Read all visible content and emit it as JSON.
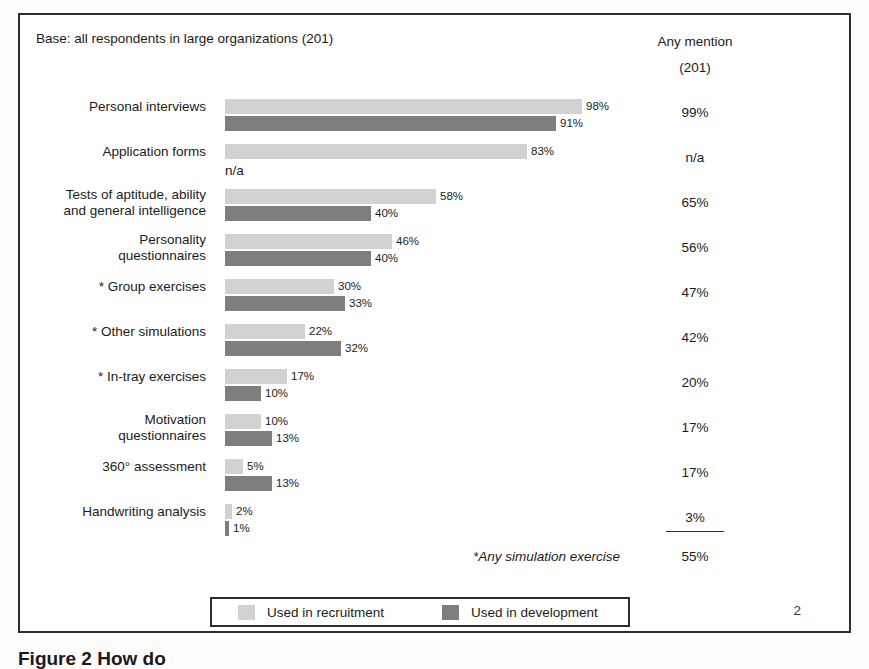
{
  "header": {
    "base_note": "Base: all respondents in large organizations (201)",
    "any_mention_title": "Any mention",
    "any_mention_base": "(201)"
  },
  "legend": {
    "recruit_label": "Used in recruitment",
    "develop_label": "Used in development",
    "recruit_color": "#d2d2d2",
    "develop_color": "#7e7e7e"
  },
  "summary": {
    "sim_label": "*Any simulation exercise",
    "sim_value": "55%"
  },
  "page_number": "2",
  "figure_caption": "Figure 2  How do",
  "chart_data": {
    "type": "bar",
    "title": "Base: all respondents in large organizations (201)",
    "xlabel": "",
    "ylabel": "",
    "xlim": [
      0,
      100
    ],
    "grid": false,
    "legend_position": "bottom",
    "orientation": "horizontal",
    "categories": [
      "Personal interviews",
      "Application forms",
      "Tests of aptitude, ability\nand general intelligence",
      "Personality\nquestionnaires",
      "* Group exercises",
      "* Other simulations",
      "* In-tray exercises",
      "Motivation\nquestionnaires",
      "360° assessment",
      "Handwriting analysis"
    ],
    "series": [
      {
        "name": "Used in recruitment",
        "color": "#d2d2d2",
        "values": [
          98,
          83,
          58,
          46,
          30,
          22,
          17,
          10,
          5,
          2
        ],
        "labels": [
          "98%",
          "83%",
          "58%",
          "46%",
          "30%",
          "22%",
          "17%",
          "10%",
          "5%",
          "2%"
        ]
      },
      {
        "name": "Used in development",
        "color": "#7e7e7e",
        "values": [
          91,
          null,
          40,
          40,
          33,
          32,
          10,
          13,
          13,
          1
        ],
        "labels": [
          "91%",
          "n/a",
          "40%",
          "40%",
          "33%",
          "32%",
          "10%",
          "13%",
          "13%",
          "1%"
        ]
      }
    ],
    "any_mention": {
      "header": "Any mention",
      "base": "(201)",
      "values": [
        "99%",
        "n/a",
        "65%",
        "56%",
        "47%",
        "42%",
        "20%",
        "17%",
        "17%",
        "3%"
      ]
    },
    "annotations": [
      {
        "text": "*Any simulation exercise",
        "value": "55%"
      }
    ]
  },
  "rows": [
    {
      "label": "Personal interviews",
      "two_line": false,
      "recruit": {
        "value": 98,
        "label": "98%"
      },
      "develop": {
        "value": 91,
        "label": "91%"
      },
      "any_mention": "99%",
      "underline": false
    },
    {
      "label": "Application forms",
      "two_line": false,
      "recruit": {
        "value": 83,
        "label": "83%"
      },
      "develop": {
        "value": null,
        "label": "n/a"
      },
      "any_mention": "n/a",
      "underline": false
    },
    {
      "label": "Tests of aptitude, ability\nand general intelligence",
      "two_line": true,
      "recruit": {
        "value": 58,
        "label": "58%"
      },
      "develop": {
        "value": 40,
        "label": "40%"
      },
      "any_mention": "65%",
      "underline": false
    },
    {
      "label": "Personality\nquestionnaires",
      "two_line": true,
      "recruit": {
        "value": 46,
        "label": "46%"
      },
      "develop": {
        "value": 40,
        "label": "40%"
      },
      "any_mention": "56%",
      "underline": false
    },
    {
      "label": "* Group exercises",
      "two_line": false,
      "recruit": {
        "value": 30,
        "label": "30%"
      },
      "develop": {
        "value": 33,
        "label": "33%"
      },
      "any_mention": "47%",
      "underline": false
    },
    {
      "label": "* Other simulations",
      "two_line": false,
      "recruit": {
        "value": 22,
        "label": "22%"
      },
      "develop": {
        "value": 32,
        "label": "32%"
      },
      "any_mention": "42%",
      "underline": false
    },
    {
      "label": "* In-tray exercises",
      "two_line": false,
      "recruit": {
        "value": 17,
        "label": "17%"
      },
      "develop": {
        "value": 10,
        "label": "10%"
      },
      "any_mention": "20%",
      "underline": false
    },
    {
      "label": "Motivation\nquestionnaires",
      "two_line": true,
      "recruit": {
        "value": 10,
        "label": "10%"
      },
      "develop": {
        "value": 13,
        "label": "13%"
      },
      "any_mention": "17%",
      "underline": false
    },
    {
      "label": "360° assessment",
      "two_line": false,
      "recruit": {
        "value": 5,
        "label": "5%"
      },
      "develop": {
        "value": 13,
        "label": "13%"
      },
      "any_mention": "17%",
      "underline": false
    },
    {
      "label": "Handwriting analysis",
      "two_line": false,
      "recruit": {
        "value": 2,
        "label": "2%"
      },
      "develop": {
        "value": 1,
        "label": "1%"
      },
      "any_mention": "3%",
      "underline": true
    }
  ],
  "scale_px_per_percent": 3.64
}
